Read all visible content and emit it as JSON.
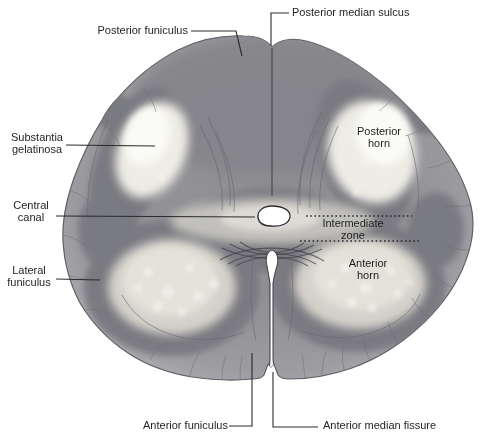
{
  "labels": {
    "posterior_median_sulcus": "Posterior median sulcus",
    "posterior_funiculus": "Posterior funiculus",
    "substantia_gelatinosa": "Substantia gelatinosa",
    "central_canal": "Central canal",
    "lateral_funiculus": "Lateral funiculus",
    "anterior_funiculus": "Anterior funiculus",
    "anterior_median_fissure": "Anterior median fissure",
    "posterior_horn": "Posterior horn",
    "intermediate_zone": "Intermediate zone",
    "anterior_horn": "Anterior horn"
  },
  "colors": {
    "background": "#ffffff",
    "white_matter": "#8d8d91",
    "gray_matter": "#7a7a81",
    "horn_light": "#e4e1d9",
    "sg_light": "#f3f1eb",
    "outline": "#5f5f66",
    "label_text": "#1f1f1f",
    "leader": "#2a2a2a"
  }
}
